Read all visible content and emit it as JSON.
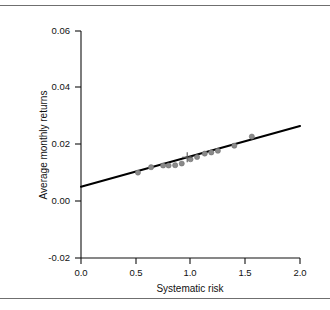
{
  "figure": {
    "has_top_rule": true,
    "has_bottom_rule": true,
    "rule_color": "#6f6f6f",
    "background": "#ffffff"
  },
  "chart_data": {
    "type": "scatter",
    "title": "",
    "xlabel": "Systematic risk",
    "ylabel": "Average monthly returns",
    "xlim": [
      0.0,
      2.0
    ],
    "ylim": [
      -0.02,
      0.06
    ],
    "xticks": [
      0.0,
      0.5,
      1.0,
      1.5,
      2.0
    ],
    "xtick_labels": [
      "0.0",
      "0.5",
      "1.0",
      "1.5",
      "2.0"
    ],
    "yticks": [
      -0.02,
      0.0,
      0.02,
      0.04,
      0.06
    ],
    "ytick_labels": [
      "-0.02",
      "0.00",
      "0.02",
      "0.04",
      "0.06"
    ],
    "grid": false,
    "legend": "none",
    "point_color": "#8a8a8a",
    "line_color": "#000000",
    "series": [
      {
        "name": "Portfolios",
        "marker": "circle",
        "x": [
          0.52,
          0.64,
          0.75,
          0.8,
          0.86,
          0.92,
          1.0,
          1.06,
          1.13,
          1.19,
          1.25,
          1.4,
          1.56
        ],
        "y": [
          0.0101,
          0.012,
          0.0126,
          0.0126,
          0.0127,
          0.0133,
          0.0148,
          0.0156,
          0.0168,
          0.0172,
          0.0178,
          0.0196,
          0.0228
        ]
      },
      {
        "name": "Market",
        "marker": "plus",
        "x": [
          0.97
        ],
        "y": [
          0.0155
        ]
      }
    ],
    "fit_line": {
      "name": "Security market line",
      "intercept": 0.0051,
      "slope": 0.0107,
      "x_start": 0.0,
      "x_end": 2.0,
      "y_start": 0.0051,
      "y_end": 0.0265
    }
  }
}
